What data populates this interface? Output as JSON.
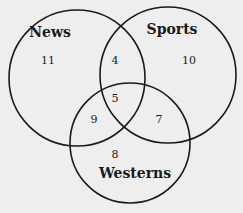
{
  "diagram": {
    "type": "venn-3",
    "sets": [
      {
        "name": "News",
        "cx": 77,
        "cy": 78,
        "r": 68,
        "label_x": 50,
        "label_y": 37
      },
      {
        "name": "Sports",
        "cx": 168,
        "cy": 75,
        "r": 68,
        "label_x": 172,
        "label_y": 34
      },
      {
        "name": "Westerns",
        "cx": 130,
        "cy": 143,
        "r": 60,
        "label_x": 135,
        "label_y": 178
      }
    ],
    "regions": {
      "news_only": {
        "value": "11",
        "x": 48,
        "y": 64
      },
      "sports_only": {
        "value": "10",
        "x": 189,
        "y": 64
      },
      "westerns_only": {
        "value": "8",
        "x": 115,
        "y": 158
      },
      "news_sports": {
        "value": "4",
        "x": 115,
        "y": 64
      },
      "news_westerns": {
        "value": "9",
        "x": 94,
        "y": 123
      },
      "sports_westerns": {
        "value": "7",
        "x": 159,
        "y": 123
      },
      "all_three": {
        "value": "5",
        "x": 115,
        "y": 102
      }
    },
    "colors": {
      "background": "#eeeeee",
      "stroke": "#1a1a1a"
    }
  }
}
